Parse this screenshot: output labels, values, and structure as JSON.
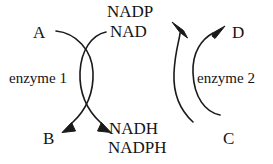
{
  "diagram": {
    "type": "coupled-enzyme-cycle",
    "background_color": "#ffffff",
    "stroke_color": "#1a1a1a",
    "text_color": "#141414",
    "substrates": {
      "left_in": "A",
      "left_out": "B",
      "right_in": "C",
      "right_out": "D"
    },
    "cofactors": {
      "oxidized_top_1": "NADP",
      "oxidized_top_2": "NAD",
      "reduced_bottom_1": "NADH",
      "reduced_bottom_2": "NADPH"
    },
    "enzymes": {
      "left": "enzyme 1",
      "right": "enzyme 2"
    },
    "arrows": [
      {
        "name": "left-substrate-arc",
        "from": "A",
        "to": "B",
        "direction": "down-left",
        "has_arrowhead": true
      },
      {
        "name": "left-cofactor-arc",
        "from": "NAD / NADP",
        "to": "NADH / NADPH",
        "direction": "down-right",
        "has_arrowhead": true
      },
      {
        "name": "right-substrate-arc",
        "from": "C",
        "to": "D",
        "direction": "up-right",
        "has_arrowhead": true
      },
      {
        "name": "right-cofactor-arc",
        "from": "NADH / NADPH",
        "to": "NAD / NADP",
        "direction": "up-left",
        "has_arrowhead": true
      }
    ]
  }
}
